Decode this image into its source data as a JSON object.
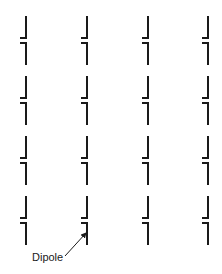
{
  "diagram": {
    "stroke_color": "#1a1a1a",
    "columns_x": [
      26,
      87,
      148,
      208
    ],
    "rows_y": [
      16,
      76,
      136,
      196
    ],
    "dipole_geometry": {
      "half_length": 22,
      "gap": 5,
      "foot_length": 6
    },
    "label": {
      "text": "Dipole",
      "x": 32,
      "y": 261
    },
    "arrow": {
      "from": [
        65,
        256
      ],
      "to": [
        86,
        233
      ]
    }
  }
}
